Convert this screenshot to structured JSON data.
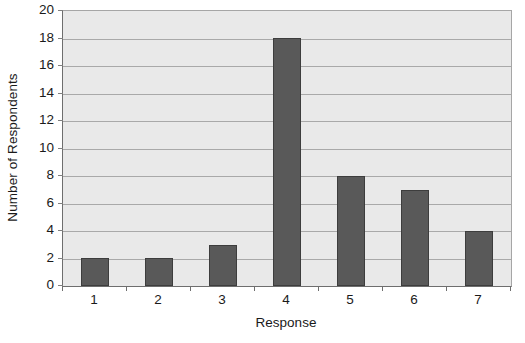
{
  "chart_data": {
    "type": "bar",
    "title": "",
    "categories": [
      "1",
      "2",
      "3",
      "4",
      "5",
      "6",
      "7"
    ],
    "values": [
      2,
      2,
      3,
      18,
      8,
      7,
      4
    ],
    "series": [
      {
        "name": "Number of Respondents",
        "values": [
          2,
          2,
          3,
          18,
          8,
          7,
          4
        ]
      }
    ],
    "xlabel": "Response",
    "ylabel": "Number of Respondents",
    "ylim": [
      0,
      20
    ],
    "ytick_step": 2,
    "yticks": [
      0,
      2,
      4,
      6,
      8,
      10,
      12,
      14,
      16,
      18,
      20
    ],
    "ytick_labels": [
      "0",
      "2",
      "4",
      "6",
      "8",
      "10",
      "12",
      "14",
      "16",
      "18",
      "20"
    ],
    "grid": true,
    "grid_axis": "y",
    "legend": false,
    "legend_position": "none",
    "bar_color": "#595959",
    "bar_border_color": "#3d3d3d",
    "plot_background": "#e9e9e9",
    "gridline_color": "#a9a9a9",
    "figure_background": "#ffffff",
    "text_color": "#1a1a1a"
  }
}
